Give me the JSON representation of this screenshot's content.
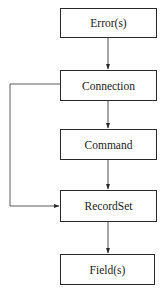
{
  "diagram": {
    "type": "object-hierarchy",
    "nodes": [
      {
        "id": "errors",
        "label": "Error(s)",
        "x": 60,
        "y": 8,
        "w": 97,
        "h": 30
      },
      {
        "id": "connection",
        "label": "Connection",
        "x": 60,
        "y": 70,
        "w": 97,
        "h": 31
      },
      {
        "id": "command",
        "label": "Command",
        "x": 60,
        "y": 129,
        "w": 97,
        "h": 31
      },
      {
        "id": "recordset",
        "label": "RecordSet",
        "x": 60,
        "y": 190,
        "w": 97,
        "h": 32
      },
      {
        "id": "fields",
        "label": "Field(s)",
        "x": 60,
        "y": 254,
        "w": 95,
        "h": 31
      }
    ],
    "edges": [
      {
        "from": "errors",
        "to": "connection",
        "style": "vertical-arrow"
      },
      {
        "from": "connection",
        "to": "command",
        "style": "vertical-arrow"
      },
      {
        "from": "command",
        "to": "recordset",
        "style": "vertical-arrow"
      },
      {
        "from": "connection",
        "to": "recordset",
        "style": "left-bypass-arrow"
      },
      {
        "from": "recordset",
        "to": "fields",
        "style": "vertical-arrow"
      }
    ],
    "colors": {
      "line": "#3a3a3a",
      "border": "#2a2a2a",
      "text": "#222222",
      "background": "#ffffff"
    }
  }
}
